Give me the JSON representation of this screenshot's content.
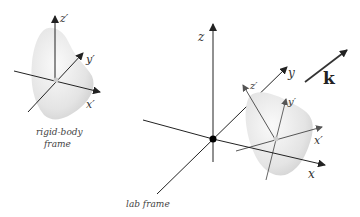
{
  "diagram": {
    "rigid_body": {
      "axis_labels": {
        "z": "z′",
        "y": "y′",
        "x": "x′"
      },
      "caption_line1": "rigid-body",
      "caption_line2": "frame"
    },
    "lab": {
      "axis_labels": {
        "z": "z",
        "y": "y",
        "x": "x"
      },
      "caption": "lab frame",
      "body_axis_labels": {
        "z": "z′",
        "y": "y′",
        "x": "x′"
      }
    },
    "wave_vector": {
      "label": "k"
    },
    "colors": {
      "axis": "#222222",
      "body_fill": "#e6e6e6",
      "body_axis": "#666666"
    }
  }
}
